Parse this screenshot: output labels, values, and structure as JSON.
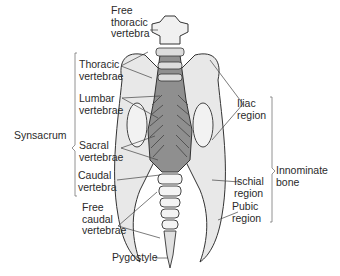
{
  "diagram": {
    "labels": {
      "free_thoracic_vertebra": "Free\nthoracic\nvertebra",
      "thoracic_vertebrae": "Thoracic\nvertebrae",
      "lumbar_vertebrae": "Lumbar\nvertebrae",
      "synsacrum": "Synsacrum",
      "sacral_vertebrae": "Sacral\nvertebrae",
      "caudal_vertebra": "Caudal\nvertebra",
      "free_caudal_vertebrae": "Free\ncaudal\nvertebrae",
      "pygostyle": "Pygostyle",
      "iliac_region": "Iliac\nregion",
      "ischial_region": "Ischial\nregion",
      "pubic_region": "Pubic\nregion",
      "innominate_bone": "Innominate\nbone"
    },
    "colors": {
      "bone": "#e6e6e6",
      "synsacrum": "#8f8f8f",
      "line": "#333333"
    }
  }
}
